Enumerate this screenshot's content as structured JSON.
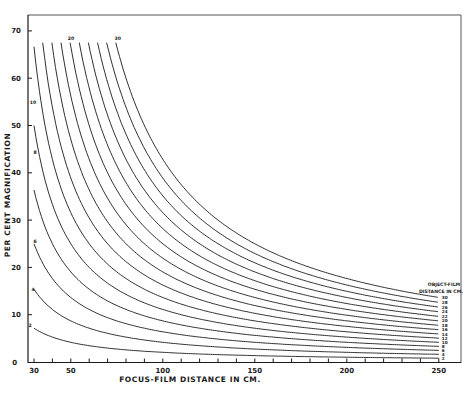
{
  "chart_data": {
    "type": "line",
    "title": "",
    "xlabel": "FOCUS-FILM DISTANCE IN CM.",
    "ylabel": "PER CENT MAGNIFICATION",
    "xlim": [
      30,
      250
    ],
    "ylim": [
      0,
      70
    ],
    "x_ticks": [
      30,
      50,
      100,
      150,
      200,
      250
    ],
    "x_minor_step": 10,
    "y_ticks": [
      0,
      10,
      20,
      30,
      40,
      50,
      60,
      70
    ],
    "grid": false,
    "legend_title": [
      "OBJECT-FILM",
      "DISTANCE IN CM."
    ],
    "legend_position": "right-end-of-curves",
    "curve_cutoff_percent": 67.5,
    "formula": "magnification% = 100 * d / (F - d)",
    "series": [
      {
        "name": "2",
        "object_film_cm": 2,
        "points": [
          [
            30,
            7.1
          ],
          [
            50,
            4.2
          ],
          [
            100,
            2.0
          ],
          [
            150,
            1.4
          ],
          [
            200,
            1.0
          ],
          [
            250,
            0.8
          ]
        ]
      },
      {
        "name": "4",
        "object_film_cm": 4,
        "points": [
          [
            30,
            15.4
          ],
          [
            50,
            8.7
          ],
          [
            100,
            4.2
          ],
          [
            150,
            2.7
          ],
          [
            200,
            2.0
          ],
          [
            250,
            1.6
          ]
        ]
      },
      {
        "name": "6",
        "object_film_cm": 6,
        "points": [
          [
            30,
            25.0
          ],
          [
            50,
            13.6
          ],
          [
            100,
            6.4
          ],
          [
            150,
            4.2
          ],
          [
            200,
            3.1
          ],
          [
            250,
            2.5
          ]
        ]
      },
      {
        "name": "8",
        "object_film_cm": 8,
        "points": [
          [
            30,
            36.4
          ],
          [
            50,
            19.0
          ],
          [
            100,
            8.7
          ],
          [
            150,
            5.6
          ],
          [
            200,
            4.2
          ],
          [
            250,
            3.3
          ]
        ]
      },
      {
        "name": "10",
        "object_film_cm": 10,
        "points": [
          [
            30,
            50.0
          ],
          [
            50,
            25.0
          ],
          [
            100,
            11.1
          ],
          [
            150,
            7.1
          ],
          [
            200,
            5.3
          ],
          [
            250,
            4.2
          ]
        ]
      },
      {
        "name": "12",
        "object_film_cm": 12,
        "points": [
          [
            30,
            66.7
          ],
          [
            50,
            31.6
          ],
          [
            100,
            13.6
          ],
          [
            150,
            8.7
          ],
          [
            200,
            6.4
          ],
          [
            250,
            5.0
          ]
        ]
      },
      {
        "name": "14",
        "object_film_cm": 14,
        "points": [
          [
            34.7,
            67.5
          ],
          [
            50,
            38.9
          ],
          [
            100,
            16.3
          ],
          [
            150,
            10.3
          ],
          [
            200,
            7.5
          ],
          [
            250,
            5.9
          ]
        ]
      },
      {
        "name": "16",
        "object_film_cm": 16,
        "points": [
          [
            39.7,
            67.5
          ],
          [
            50,
            47.1
          ],
          [
            100,
            19.0
          ],
          [
            150,
            11.9
          ],
          [
            200,
            8.7
          ],
          [
            250,
            6.8
          ]
        ]
      },
      {
        "name": "18",
        "object_film_cm": 18,
        "points": [
          [
            44.7,
            67.5
          ],
          [
            50,
            56.3
          ],
          [
            100,
            22.0
          ],
          [
            150,
            13.6
          ],
          [
            200,
            9.9
          ],
          [
            250,
            7.8
          ]
        ]
      },
      {
        "name": "20",
        "object_film_cm": 20,
        "points": [
          [
            49.6,
            67.5
          ],
          [
            50,
            66.7
          ],
          [
            100,
            25.0
          ],
          [
            150,
            15.4
          ],
          [
            200,
            11.1
          ],
          [
            250,
            8.7
          ]
        ]
      },
      {
        "name": "22",
        "object_film_cm": 22,
        "points": [
          [
            54.6,
            67.5
          ],
          [
            100,
            28.2
          ],
          [
            150,
            17.2
          ],
          [
            200,
            12.4
          ],
          [
            250,
            9.6
          ]
        ]
      },
      {
        "name": "24",
        "object_film_cm": 24,
        "points": [
          [
            59.6,
            67.5
          ],
          [
            100,
            31.6
          ],
          [
            150,
            19.0
          ],
          [
            200,
            13.6
          ],
          [
            250,
            10.6
          ]
        ]
      },
      {
        "name": "26",
        "object_film_cm": 26,
        "points": [
          [
            64.5,
            67.5
          ],
          [
            100,
            35.1
          ],
          [
            150,
            21.0
          ],
          [
            200,
            14.9
          ],
          [
            250,
            11.6
          ]
        ]
      },
      {
        "name": "28",
        "object_film_cm": 28,
        "points": [
          [
            69.5,
            67.5
          ],
          [
            100,
            38.9
          ],
          [
            150,
            22.8
          ],
          [
            200,
            16.1
          ],
          [
            250,
            12.6
          ]
        ]
      },
      {
        "name": "30",
        "object_film_cm": 30,
        "points": [
          [
            74.4,
            67.5
          ],
          [
            100,
            42.9
          ],
          [
            150,
            25.0
          ],
          [
            200,
            17.6
          ],
          [
            250,
            13.6
          ]
        ]
      }
    ],
    "annotations": [
      {
        "text": "20",
        "at": "top of curve 20"
      },
      {
        "text": "30",
        "at": "top of curve 30"
      },
      {
        "text": "10",
        "at": "left start of curve 10"
      },
      {
        "text": "8",
        "at": "left start of curve 8"
      },
      {
        "text": "6",
        "at": "left start of curve 6"
      },
      {
        "text": "4",
        "at": "left start of curve 4"
      },
      {
        "text": "2",
        "at": "left start of curve 2"
      }
    ]
  },
  "labels": {
    "xlabel": "FOCUS-FILM DISTANCE IN CM.",
    "ylabel": "PER CENT MAGNIFICATION",
    "legend_line1": "OBJECT-FILM",
    "legend_line2": "DISTANCE IN CM."
  },
  "style": {
    "ink": "#1a1a1a",
    "frame": "#555555",
    "background": "#ffffff"
  }
}
